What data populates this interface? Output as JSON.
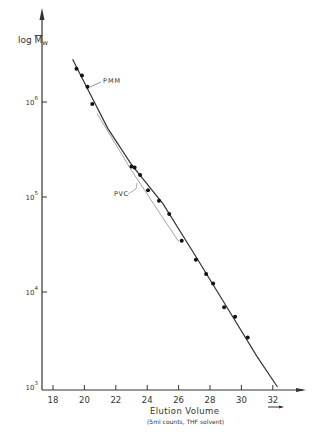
{
  "chart_data": {
    "type": "scatter",
    "title": "",
    "xlabel": "Elution Volume",
    "xlabel_sub": "(5ml counts, THF solvent)",
    "ylabel": "log M̅w",
    "ylabel_base": "log ",
    "ylabel_var": "M",
    "ylabel_sub": "w",
    "xlim": [
      17.3,
      33.5
    ],
    "ylim_log10": [
      3,
      6.7
    ],
    "x_ticks": [
      18,
      20,
      22,
      24,
      26,
      28,
      30,
      32
    ],
    "x_tick_labels": [
      "18",
      "20",
      "22",
      "24",
      "26",
      "28",
      "30",
      "32"
    ],
    "y_ticks_log10": [
      3,
      4,
      5,
      6
    ],
    "y_tick_labels": [
      {
        "base": "10",
        "exp": "3"
      },
      {
        "base": "10",
        "exp": "4"
      },
      {
        "base": "10",
        "exp": "5"
      },
      {
        "base": "10",
        "exp": "6"
      }
    ],
    "grid": false,
    "legend": "none (inline annotations)",
    "series": [
      {
        "name": "PMM",
        "kind": "calibration points + fitted line",
        "points_x": [
          19.5,
          19.85,
          20.2,
          20.5,
          23.0,
          23.2,
          23.55,
          24.05,
          24.75,
          25.4,
          26.2,
          27.1,
          27.75,
          28.2,
          28.9,
          29.6,
          30.4
        ],
        "points_log10y": [
          6.35,
          6.28,
          6.16,
          5.98,
          5.32,
          5.31,
          5.23,
          5.07,
          4.96,
          4.82,
          4.54,
          4.34,
          4.19,
          4.09,
          3.84,
          3.74,
          3.52
        ],
        "line_x": [
          19.25,
          20.2,
          21.5,
          23.0,
          25.0,
          27.0,
          29.0,
          31.0,
          32.3
        ],
        "line_log10y": [
          6.45,
          6.14,
          5.72,
          5.34,
          4.93,
          4.4,
          3.86,
          3.32,
          3.0
        ]
      },
      {
        "name": "PVC",
        "kind": "calibration line",
        "line_x": [
          20.8,
          23.0,
          26.0
        ],
        "line_log10y": [
          5.88,
          5.28,
          4.53
        ]
      }
    ],
    "annotations": [
      {
        "text": "PMM",
        "x": 21.0,
        "log10y": 6.25
      },
      {
        "text": "PVC",
        "x": 22.3,
        "log10y": 5.15
      }
    ]
  }
}
